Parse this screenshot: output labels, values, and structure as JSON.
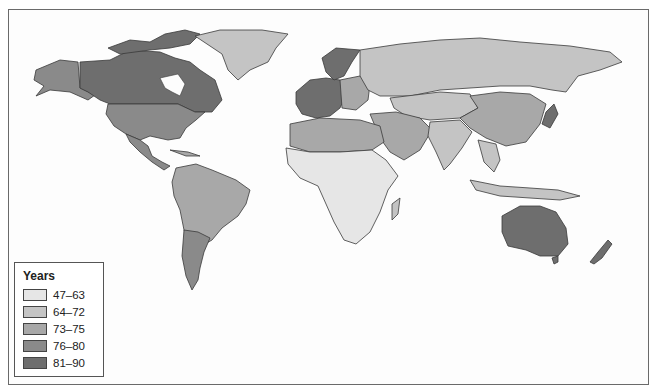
{
  "map": {
    "subject": "Life expectancy by country",
    "projection": "world",
    "legend": {
      "title": "Years",
      "items": [
        {
          "label": "47–63",
          "color": "#e6e6e6"
        },
        {
          "label": "64–72",
          "color": "#c4c4c4"
        },
        {
          "label": "73–75",
          "color": "#a8a8a8"
        },
        {
          "label": "76–80",
          "color": "#8a8a8a"
        },
        {
          "label": "81–90",
          "color": "#6e6e6e"
        }
      ]
    },
    "regions": [
      {
        "name": "Canada",
        "class": "81–90"
      },
      {
        "name": "United States",
        "class": "76–80"
      },
      {
        "name": "Alaska",
        "class": "76–80"
      },
      {
        "name": "Greenland",
        "class": "64–72"
      },
      {
        "name": "Mexico",
        "class": "76–80"
      },
      {
        "name": "South America (Brazil etc.)",
        "class": "73–75"
      },
      {
        "name": "Argentina/Chile",
        "class": "76–80"
      },
      {
        "name": "Western Europe",
        "class": "81–90"
      },
      {
        "name": "Russia",
        "class": "64–72"
      },
      {
        "name": "China",
        "class": "73–75"
      },
      {
        "name": "India",
        "class": "64–72"
      },
      {
        "name": "Sub-Saharan Africa",
        "class": "47–63"
      },
      {
        "name": "North Africa",
        "class": "73–75"
      },
      {
        "name": "Middle East",
        "class": "73–75"
      },
      {
        "name": "Australia",
        "class": "81–90"
      },
      {
        "name": "New Zealand",
        "class": "81–90"
      },
      {
        "name": "Japan",
        "class": "81–90"
      },
      {
        "name": "Southeast Asia",
        "class": "64–72"
      }
    ]
  }
}
